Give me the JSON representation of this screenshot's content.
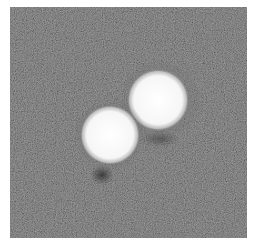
{
  "image": {
    "description": "Grayscale micrograph showing two bright circular particles on a noisy gray background",
    "background_color": "#5e5e5e",
    "particles": [
      {
        "name": "upper-right",
        "cx": 148,
        "cy": 93,
        "r": 29,
        "color": "#f8f8f8"
      },
      {
        "name": "lower-left",
        "cx": 100,
        "cy": 128,
        "r": 28,
        "color": "#fafafa"
      }
    ]
  }
}
